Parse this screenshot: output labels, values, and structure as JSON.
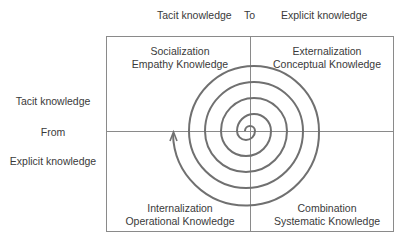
{
  "header": {
    "from_label": "Tacit knowledge",
    "connector": "To",
    "to_label": "Explicit knowledge"
  },
  "side": {
    "tacit_label": "Tacit knowledge",
    "connector": "From",
    "explicit_label": "Explicit knowledge"
  },
  "quadrants": [
    {
      "position": "top-left",
      "mode": "Socialization",
      "knowledge": "Empathy Knowledge"
    },
    {
      "position": "top-right",
      "mode": "Externalization",
      "knowledge": "Conceptual Knowledge"
    },
    {
      "position": "bottom-left",
      "mode": "Internalization",
      "knowledge": "Operational Knowledge"
    },
    {
      "position": "bottom-right",
      "mode": "Combination",
      "knowledge": "Systematic Knowledge"
    }
  ],
  "colors": {
    "grid_line": "#8a8a8a",
    "spiral": "#707070",
    "text": "#3a3a3a"
  }
}
